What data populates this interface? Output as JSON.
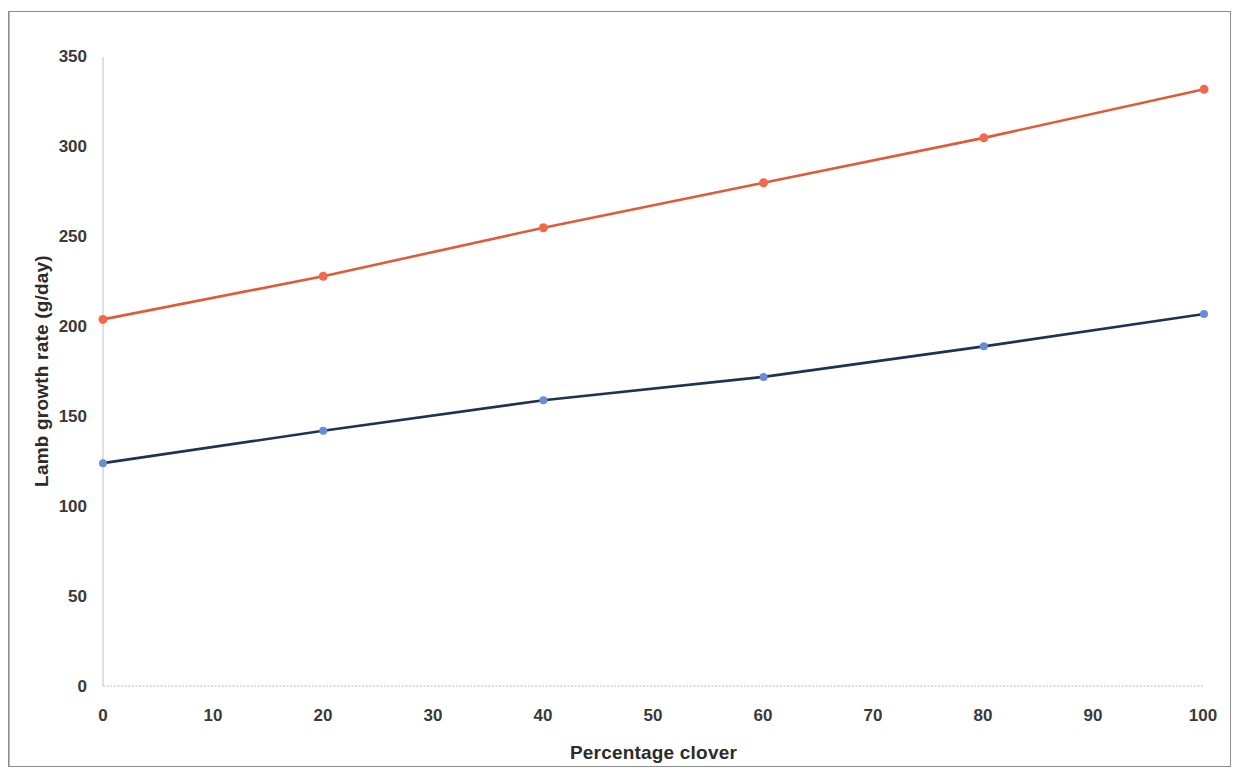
{
  "figure": {
    "border_color": "#8e8e8e",
    "background": "#ffffff"
  },
  "chart_data": {
    "type": "line",
    "title": "",
    "xlabel": "Percentage clover",
    "ylabel": "Lamb growth rate (g/day)",
    "x": [
      0,
      20,
      40,
      60,
      80,
      100
    ],
    "xlim": [
      0,
      100
    ],
    "ylim": [
      0,
      350
    ],
    "xticks": [
      0,
      10,
      20,
      30,
      40,
      50,
      60,
      70,
      80,
      90,
      100
    ],
    "xticklabels": [
      "0",
      "10",
      "20",
      "30",
      "40",
      "50",
      "60",
      "70",
      "80",
      "90",
      "100"
    ],
    "yticks": [
      0,
      50,
      100,
      150,
      200,
      250,
      300,
      350
    ],
    "yticklabels": [
      "0",
      "50",
      "100",
      "150",
      "200",
      "250",
      "300",
      "350"
    ],
    "grid": false,
    "legend": "none",
    "series": [
      {
        "name": "upper-series",
        "values": [
          204,
          228,
          255,
          280,
          305,
          332
        ],
        "line_color": "#dd5c3a",
        "marker_color": "#f1694a",
        "marker_size": 9
      },
      {
        "name": "lower-series",
        "values": [
          124,
          142,
          159,
          172,
          189,
          207
        ],
        "line_color": "#1f3254",
        "marker_color": "#6c8bd6",
        "marker_size": 8
      }
    ],
    "axis_line_color": "#c9c9c9"
  }
}
